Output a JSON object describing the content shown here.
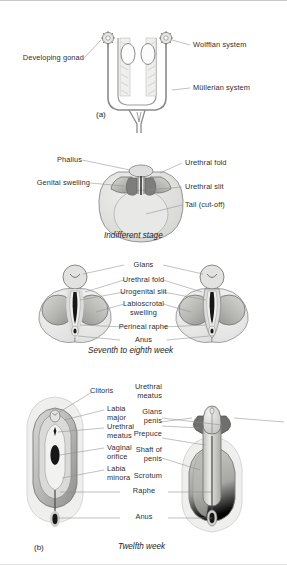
{
  "figure": {
    "panels": [
      {
        "id": "a",
        "panel_label": "(a)",
        "caption": "",
        "labels": [
          {
            "name": "developing-gonad",
            "text": "Developing gonad",
            "side": "left"
          },
          {
            "name": "wolffian-system",
            "text": "Wolffian system",
            "side": "right"
          },
          {
            "name": "mullerian-system",
            "text": "Müllerian system",
            "side": "right"
          }
        ]
      },
      {
        "id": "indifferent",
        "panel_label": "",
        "caption": "Indifferent stage",
        "labels": [
          {
            "name": "phallus",
            "text": "Phallus",
            "side": "left"
          },
          {
            "name": "genital-swelling",
            "text": "Genital swelling",
            "side": "left"
          },
          {
            "name": "urethral-fold",
            "text": "Urethral fold",
            "side": "right"
          },
          {
            "name": "urethral-slit",
            "text": "Urethral slit",
            "side": "right"
          },
          {
            "name": "tail-cut-off",
            "text": "Tail (cut-off)",
            "side": "right"
          }
        ]
      },
      {
        "id": "seventh-eighth",
        "panel_label": "",
        "caption": "Seventh to eighth week",
        "labels": [
          {
            "name": "glans",
            "text": "Glans",
            "side": "center"
          },
          {
            "name": "urethral-fold",
            "text": "Urethral fold",
            "side": "center"
          },
          {
            "name": "urogenital-slit",
            "text": "Urogenital slit",
            "side": "center"
          },
          {
            "name": "labioscrotal-swelling",
            "text": "Labioscrotal\nswelling",
            "side": "center"
          },
          {
            "name": "perineal-raphe",
            "text": "Perineal raphe",
            "side": "center"
          },
          {
            "name": "anus",
            "text": "Anus",
            "side": "center"
          }
        ]
      },
      {
        "id": "b",
        "panel_label": "(b)",
        "caption": "Twelfth week",
        "labels_female": [
          {
            "name": "clitoris",
            "text": "Clitoris"
          },
          {
            "name": "labia-major",
            "text": "Labia\nmajor"
          },
          {
            "name": "urethral-meatus",
            "text": "Urethral\nmeatus"
          },
          {
            "name": "vaginal-orifice",
            "text": "Vaginal\norifice"
          },
          {
            "name": "labia-minora",
            "text": "Labia\nminora"
          }
        ],
        "labels_male": [
          {
            "name": "urethral-meatus",
            "text": "Urethral\nmeatus"
          },
          {
            "name": "glans-penis",
            "text": "Glans\npenis"
          },
          {
            "name": "prepuce",
            "text": "Prepuce"
          },
          {
            "name": "shaft-of-penis",
            "text": "Shaft of\npenis"
          },
          {
            "name": "scrotum",
            "text": "Scrotum"
          }
        ],
        "labels_shared": [
          {
            "name": "raphe",
            "text": "Raphe"
          },
          {
            "name": "anus",
            "text": "Anus"
          }
        ]
      }
    ],
    "colors": {
      "ink": "#2b2b2b",
      "leader": "#8d8d8d",
      "outline": "#7a7a7a",
      "fill_light": "#ecece9",
      "fill_mid": "#c9c9c6",
      "fill_dark": "#9a9a98",
      "fill_deep": "#6f6f6e",
      "slit": "#17171a",
      "background": "#ffffff"
    }
  }
}
